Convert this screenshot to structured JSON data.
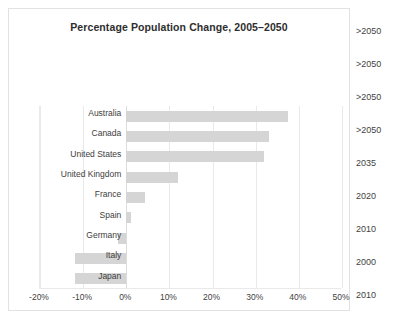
{
  "chart_data": {
    "type": "bar",
    "orientation": "horizontal",
    "title": "Percentage Population Change, 2005–2050",
    "xlabel": "",
    "ylabel": "",
    "xlim": [
      -20,
      50
    ],
    "xtick_step": 10,
    "xticks": [
      "-20%",
      "-10%",
      "0%",
      "10%",
      "20%",
      "30%",
      "40%",
      "50%"
    ],
    "xtick_values": [
      -20,
      -10,
      0,
      10,
      20,
      30,
      40,
      50
    ],
    "grid": true,
    "legend": "none",
    "bar_color": "#d5d5d5",
    "categories": [
      "Australia",
      "Canada",
      "United States",
      "United Kingdom",
      "France",
      "Spain",
      "Germany",
      "Italy",
      "Japan"
    ],
    "values": [
      37.5,
      33,
      32,
      12,
      4.3,
      1,
      -2,
      -12,
      -12
    ],
    "series": [
      {
        "name": "Percentage population change 2005–2050",
        "values": [
          37.5,
          33,
          32,
          12,
          4.3,
          1,
          -2,
          -12,
          -12
        ]
      }
    ],
    "secondary_axis": {
      "title": "Population peak year",
      "labels": [
        ">2050",
        ">2050",
        ">2050",
        ">2050",
        "2035",
        "2020",
        "2010",
        "2000",
        "2010"
      ]
    }
  }
}
